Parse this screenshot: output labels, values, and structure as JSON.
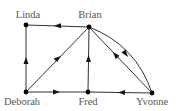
{
  "diagram": {
    "type": "directed-graph",
    "nodes": [
      {
        "id": "linda",
        "label": "Linda",
        "x": 26,
        "y": 25,
        "label_x": 28,
        "label_y": 18
      },
      {
        "id": "brian",
        "label": "Brian",
        "x": 89,
        "y": 27,
        "label_x": 90,
        "label_y": 18
      },
      {
        "id": "deborah",
        "label": "Deborah",
        "x": 26,
        "y": 92,
        "label_x": 22,
        "label_y": 105
      },
      {
        "id": "fred",
        "label": "Fred",
        "x": 88,
        "y": 92,
        "label_x": 88,
        "label_y": 105
      },
      {
        "id": "yvonne",
        "label": "Yvonne",
        "x": 152,
        "y": 93,
        "label_x": 152,
        "label_y": 105
      }
    ],
    "edges": [
      {
        "from": "Brian",
        "to": "Linda",
        "shape": "straight"
      },
      {
        "from": "Deborah",
        "to": "Linda",
        "shape": "straight"
      },
      {
        "from": "Deborah",
        "to": "Brian",
        "shape": "straight"
      },
      {
        "from": "Fred",
        "to": "Brian",
        "shape": "straight"
      },
      {
        "from": "Deborah",
        "to": "Fred",
        "shape": "straight"
      },
      {
        "from": "Yvonne",
        "to": "Fred",
        "shape": "straight"
      },
      {
        "from": "Brian",
        "to": "Yvonne",
        "shape": "curved"
      },
      {
        "from": "Yvonne",
        "to": "Brian",
        "shape": "straight"
      }
    ],
    "colors": {
      "edge": "#1a1a1a",
      "node": "#000000",
      "label": "#555555",
      "background": "#ffffff"
    }
  }
}
